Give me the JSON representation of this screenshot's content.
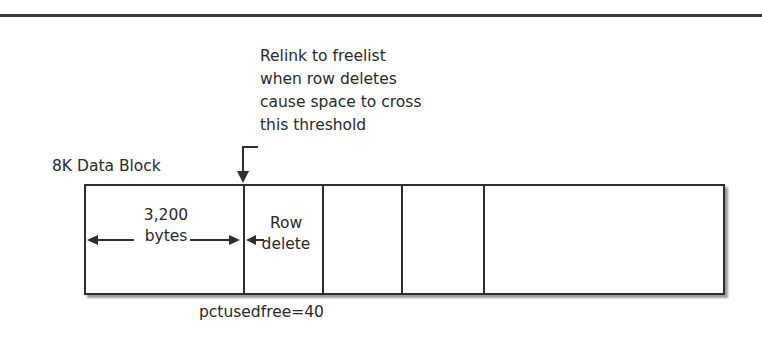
{
  "diagram": {
    "title": "8K Data Block",
    "annotation": {
      "lines": [
        "Relink to freelist",
        "when row deletes",
        "cause space to cross",
        "this threshold"
      ]
    },
    "block": {
      "segments": [
        {
          "id": "used",
          "label_top": "3,200",
          "label_bottom": "bytes"
        },
        {
          "id": "row-delete",
          "label_top": "Row",
          "label_bottom": "delete"
        },
        {
          "id": "seg3"
        },
        {
          "id": "seg4"
        },
        {
          "id": "free"
        }
      ]
    },
    "threshold_label": "pctusedfree=40",
    "colors": {
      "line": "#2e2e2e",
      "text": "#2a2a2a",
      "shadow": "#9a9a9a"
    }
  }
}
